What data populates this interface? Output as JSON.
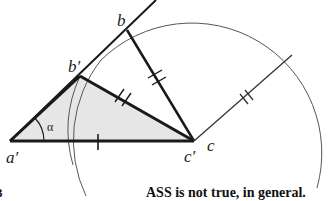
{
  "figure": {
    "caption": "ASS is not true, in general.",
    "edge_fragment": "3",
    "labels": {
      "b": "b",
      "b_prime": "b′",
      "a_prime": "a′",
      "c_prime": "c′",
      "c": "c",
      "alpha": "α"
    },
    "points": {
      "a_prime": [
        10,
        141
      ],
      "b_prime": [
        80,
        76
      ],
      "b": [
        127,
        30
      ],
      "c_prime": [
        194,
        141
      ],
      "c": [
        194,
        141
      ],
      "ray_end": [
        156,
        0
      ],
      "radius_end": [
        292,
        55
      ]
    },
    "colors": {
      "stroke": "#1a1a1a",
      "thin_stroke": "#444444",
      "shade": "#e6e6e6"
    }
  }
}
